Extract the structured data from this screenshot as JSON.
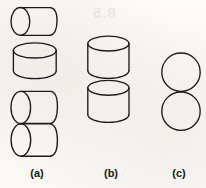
{
  "figure": {
    "kind": "line-drawing",
    "background_color": "#fbfaf8",
    "stroke_color": "#1d1b1a",
    "ghost_text_color": "#e9e6e1"
  },
  "panels": [
    {
      "id": "a",
      "label": "(a)",
      "shapes": [
        {
          "name": "horizontal-cylinder-top",
          "type": "cylinder",
          "orientation": "horizontal",
          "x": 11,
          "y": 7,
          "width": 45,
          "height": 29
        },
        {
          "name": "vertical-cylinder-middle",
          "type": "cylinder",
          "orientation": "vertical",
          "x": 13,
          "y": 43,
          "width": 44,
          "height": 36
        },
        {
          "name": "horizontal-cylinder-lower-upper",
          "type": "cylinder",
          "orientation": "horizontal",
          "x": 11,
          "y": 91,
          "width": 46,
          "height": 34
        },
        {
          "name": "horizontal-cylinder-lower-lower",
          "type": "cylinder",
          "orientation": "horizontal",
          "x": 11,
          "y": 125,
          "width": 46,
          "height": 34
        }
      ]
    },
    {
      "id": "b",
      "label": "(b)",
      "shapes": [
        {
          "name": "vertical-cylinder-top",
          "type": "cylinder",
          "orientation": "vertical",
          "x": 88,
          "y": 36,
          "width": 41,
          "height": 42
        },
        {
          "name": "vertical-cylinder-bottom",
          "type": "cylinder",
          "orientation": "vertical",
          "x": 88,
          "y": 80,
          "width": 41,
          "height": 42
        }
      ]
    },
    {
      "id": "c",
      "label": "(c)",
      "shapes": [
        {
          "name": "circle-top",
          "type": "circle",
          "cx": 181,
          "cy": 72,
          "r": 19
        },
        {
          "name": "circle-bottom",
          "type": "circle",
          "cx": 181,
          "cy": 111,
          "r": 19
        }
      ]
    }
  ],
  "ghost_text": {
    "heading": "8.5",
    "line_1": "",
    "line_2": "",
    "line_3": "",
    "line_4": "",
    "line_5": ""
  }
}
